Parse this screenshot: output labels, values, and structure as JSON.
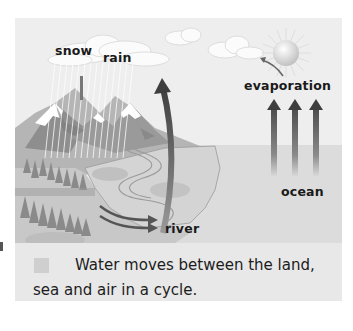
{
  "diagram": {
    "labels": {
      "snow": "snow",
      "rain": "rain",
      "evaporation": "evaporation",
      "ocean": "ocean",
      "river": "river"
    },
    "elements": [
      "clouds",
      "sun",
      "mountains",
      "snow-caps",
      "rain-streaks",
      "forest",
      "river",
      "ocean",
      "evaporation-arrows",
      "precipitation-arrow",
      "runoff-arrows"
    ],
    "colors": {
      "sky": "#eeeeee",
      "sea": "#dcdcdc",
      "mountain_dark": "#8a8a8a",
      "mountain_mid": "#a8a8a8",
      "land": "#c9c9c9",
      "arrow": "#555555",
      "text": "#1a1a1a"
    }
  },
  "caption": {
    "text": "Water moves between the land, sea and air in a cycle."
  }
}
